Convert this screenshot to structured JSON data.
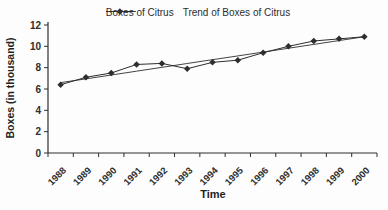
{
  "figure": {
    "background": "#fdfdfd",
    "ink_color": "#2e2e2e"
  },
  "chart_data": {
    "type": "line",
    "title": "",
    "xlabel": "Time",
    "ylabel": "Boxes (in thousand)",
    "categories": [
      "1988",
      "1989",
      "1990",
      "1991",
      "1992",
      "1993",
      "1994",
      "1995",
      "1996",
      "1997",
      "1998",
      "1999",
      "2000"
    ],
    "series": [
      {
        "name": "Boxes of Citrus",
        "marker": "diamond",
        "values": [
          6.4,
          7.1,
          7.5,
          8.3,
          8.4,
          7.9,
          8.5,
          8.7,
          9.4,
          10.0,
          10.5,
          10.7,
          10.9
        ]
      },
      {
        "name": "Trend of Boxes of Citrus",
        "marker": "none",
        "values": [
          6.6,
          6.95,
          7.31,
          7.67,
          8.03,
          8.39,
          8.75,
          9.1,
          9.46,
          9.82,
          10.18,
          10.54,
          10.9
        ]
      }
    ],
    "ylim": [
      0,
      12
    ],
    "yticks": [
      0,
      2,
      4,
      6,
      8,
      10,
      12
    ],
    "grid": false,
    "legend_position": "top"
  }
}
